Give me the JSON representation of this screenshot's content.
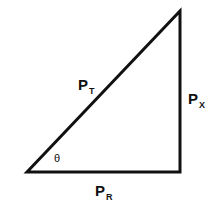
{
  "diagram": {
    "vertices": {
      "left": [
        27,
        172
      ],
      "apex": [
        180,
        11
      ],
      "corner": [
        180,
        172
      ]
    },
    "stroke_color": "#111111",
    "labels": {
      "hypotenuse": {
        "main": "P",
        "sub": "T"
      },
      "vertical": {
        "main": "P",
        "sub": "X"
      },
      "base": {
        "main": "P",
        "sub": "R"
      },
      "angle": "θ"
    }
  }
}
